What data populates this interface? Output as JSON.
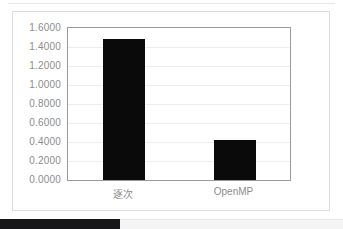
{
  "chart_data": {
    "type": "bar",
    "title": "",
    "xlabel": "",
    "ylabel": "",
    "categories": [
      "逐次",
      "OpenMP"
    ],
    "values": [
      1.48,
      0.42
    ],
    "ylim": [
      0.0,
      1.6
    ],
    "ytick_step": 0.2,
    "yticks": [
      1.6,
      1.4,
      1.2,
      1.0,
      0.8,
      0.6,
      0.4,
      0.2,
      0.0
    ],
    "ytick_labels": [
      "1.6000",
      "1.4000",
      "1.2000",
      "1.0000",
      "0.8000",
      "0.6000",
      "0.4000",
      "0.2000",
      "0.0000"
    ],
    "grid": true,
    "grid_axis": "y",
    "legend": false,
    "legend_position": "none",
    "bar_color": "#0a0a0a",
    "gridline_color": "#ededed",
    "axis_color": "#9a9a9a",
    "tick_label_color": "#8c8c8c",
    "plot_background": "#ffffff"
  },
  "frame": {
    "border_color": "#dcdcdc",
    "background": "#ffffff"
  },
  "bottom_strip": {
    "fill_width_px": 120,
    "fill_color": "#17171a",
    "track_color": "#f4f4f4"
  }
}
